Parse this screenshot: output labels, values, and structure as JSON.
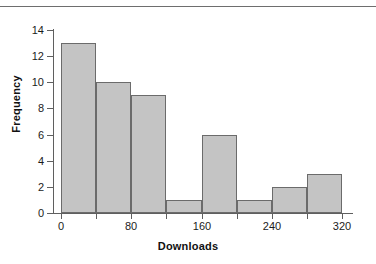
{
  "figure": {
    "background_color": "#ffffff",
    "top_rule_color": "#6e6e6e",
    "axis_color": "#5f5f5f",
    "text_color": "#1b1b1b",
    "title_color": "#111111"
  },
  "chart_data": {
    "type": "bar",
    "subtype": "histogram",
    "title": "",
    "subtitle": "",
    "xlabel": "Downloads",
    "ylabel": "Frequency",
    "xlim": [
      0,
      320
    ],
    "ylim": [
      0,
      14
    ],
    "bin_width": 40,
    "grid": false,
    "legend": false,
    "legend_position": "none",
    "bar_fill_color": "#c4c4c4",
    "bar_edge_color": "#6b6b6b",
    "categories": [
      "0-40",
      "40-80",
      "80-120",
      "120-160",
      "160-200",
      "200-240",
      "240-280",
      "280-320"
    ],
    "bin_edges": [
      0,
      40,
      80,
      120,
      160,
      200,
      240,
      280,
      320
    ],
    "values": [
      13,
      10,
      9,
      1,
      6,
      1,
      2,
      3
    ],
    "bars": [
      {
        "bin_start": 0,
        "bin_end": 40,
        "value": 13
      },
      {
        "bin_start": 40,
        "bin_end": 80,
        "value": 10
      },
      {
        "bin_start": 80,
        "bin_end": 120,
        "value": 9
      },
      {
        "bin_start": 120,
        "bin_end": 160,
        "value": 1
      },
      {
        "bin_start": 160,
        "bin_end": 200,
        "value": 6
      },
      {
        "bin_start": 200,
        "bin_end": 240,
        "value": 1
      },
      {
        "bin_start": 240,
        "bin_end": 280,
        "value": 2
      },
      {
        "bin_start": 280,
        "bin_end": 320,
        "value": 3
      }
    ],
    "yticks": [
      0,
      2,
      4,
      6,
      8,
      10,
      12,
      14
    ],
    "ytick_labels": [
      "0",
      "2",
      "4",
      "6",
      "8",
      "10",
      "12",
      "14"
    ],
    "xticks": [
      0,
      40,
      80,
      120,
      160,
      200,
      240,
      280,
      320
    ],
    "xtick_labels": [
      "0",
      "",
      "80",
      "",
      "160",
      "",
      "240",
      "",
      "320"
    ],
    "annotations": []
  }
}
